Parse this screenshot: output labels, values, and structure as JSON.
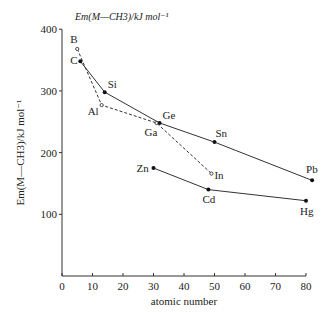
{
  "chart_data": {
    "type": "line",
    "top_label": "Em(M—CH3)/kJ mol⁻¹",
    "xlabel": "atomic number",
    "ylabel": "Em(M—CH3)/kJ mol⁻¹",
    "xlim": [
      0,
      82
    ],
    "ylim": [
      0,
      400
    ],
    "xticks": [
      0,
      10,
      20,
      30,
      40,
      50,
      60,
      70,
      80
    ],
    "yticks": [
      100,
      200,
      300,
      400
    ],
    "grid": false,
    "series": [
      {
        "name": "Group 14 (C, Si, Ge, Sn, Pb)",
        "style": "solid",
        "marker": "filled",
        "points": [
          {
            "label": "C",
            "x": 6,
            "y": 348
          },
          {
            "label": "Si",
            "x": 14,
            "y": 298
          },
          {
            "label": "Ge",
            "x": 32,
            "y": 248
          },
          {
            "label": "Sn",
            "x": 50,
            "y": 217
          },
          {
            "label": "Pb",
            "x": 82,
            "y": 155
          }
        ]
      },
      {
        "name": "Group 13 (B, Al, Ga, In)",
        "style": "dashed",
        "marker": "open",
        "points": [
          {
            "label": "B",
            "x": 5,
            "y": 368
          },
          {
            "label": "Al",
            "x": 13,
            "y": 277
          },
          {
            "label": "Ga",
            "x": 31,
            "y": 248
          },
          {
            "label": "In",
            "x": 49,
            "y": 166
          }
        ]
      },
      {
        "name": "Group 12 (Zn, Cd, Hg)",
        "style": "solid",
        "marker": "filled",
        "points": [
          {
            "label": "Zn",
            "x": 30,
            "y": 175
          },
          {
            "label": "Cd",
            "x": 48,
            "y": 140
          },
          {
            "label": "Hg",
            "x": 80,
            "y": 122
          }
        ]
      }
    ]
  }
}
